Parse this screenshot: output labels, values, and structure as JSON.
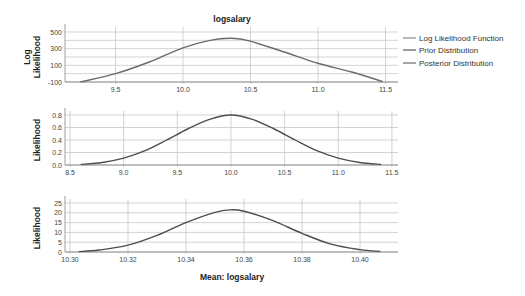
{
  "chart_data": [
    {
      "type": "line",
      "title": "logsalary",
      "xlabel": "",
      "ylabel": "Log Likelihood",
      "x_ticks": [
        "9.5",
        "10.0",
        "10.5",
        "11.0",
        "11.5"
      ],
      "y_ticks": [
        "500",
        "300",
        "100",
        "-100"
      ],
      "xlim": [
        9.125,
        11.6
      ],
      "ylim": [
        -100,
        550
      ],
      "grid": true,
      "series": [
        {
          "name": "Log Likelihood Function",
          "x": [
            9.24,
            9.5,
            9.75,
            10.0,
            10.2,
            10.36,
            10.5,
            10.75,
            11.0,
            11.25,
            11.48
          ],
          "y": [
            -100,
            0,
            140,
            310,
            400,
            425,
            390,
            260,
            125,
            20,
            -95
          ]
        }
      ],
      "legend": [
        "Log Likelihood Function",
        "Prior Distribution",
        "Posterior Distribution"
      ],
      "legend_position": "right"
    },
    {
      "type": "line",
      "title": "",
      "xlabel": "",
      "ylabel": "Likelihood",
      "x_ticks": [
        "8.5",
        "9.0",
        "9.5",
        "10.0",
        "10.5",
        "11.0",
        "11.5"
      ],
      "y_ticks": [
        "0.8",
        "0.6",
        "0.4",
        "0.2",
        "0.0"
      ],
      "xlim": [
        8.45,
        11.52
      ],
      "ylim": [
        0,
        0.85
      ],
      "grid": true,
      "series": [
        {
          "name": "Prior Distribution",
          "x": [
            8.6,
            8.8,
            9.0,
            9.2,
            9.4,
            9.6,
            9.8,
            10.0,
            10.2,
            10.4,
            10.6,
            10.8,
            11.0,
            11.2,
            11.4
          ],
          "y": [
            0.01,
            0.04,
            0.11,
            0.23,
            0.4,
            0.58,
            0.73,
            0.8,
            0.73,
            0.58,
            0.4,
            0.23,
            0.11,
            0.04,
            0.01
          ]
        }
      ]
    },
    {
      "type": "line",
      "title": "",
      "xlabel": "Mean: logsalary",
      "ylabel": "Likelihood",
      "x_ticks": [
        "10.30",
        "10.32",
        "10.34",
        "10.36",
        "10.38",
        "10.40"
      ],
      "y_ticks": [
        "25",
        "20",
        "15",
        "10",
        "5",
        "0"
      ],
      "xlim": [
        10.298,
        10.412
      ],
      "ylim": [
        0,
        27
      ],
      "grid": true,
      "series": [
        {
          "name": "Posterior Distribution",
          "x": [
            10.303,
            10.31,
            10.32,
            10.33,
            10.34,
            10.35,
            10.355,
            10.36,
            10.37,
            10.38,
            10.39,
            10.4,
            10.407
          ],
          "y": [
            0.2,
            1.0,
            3.5,
            8.5,
            15.0,
            20.2,
            21.5,
            20.8,
            16.0,
            9.5,
            4.0,
            1.2,
            0.3
          ]
        }
      ]
    }
  ],
  "labels": {
    "title": "logsalary",
    "chart1_ylabel_line1": "Log",
    "chart1_ylabel_line2": "Likelihood",
    "chart2_ylabel": "Likelihood",
    "chart3_ylabel": "Likelihood",
    "xlabel": "Mean: logsalary",
    "legend": [
      "Log Likelihood Function",
      "Prior Distribution",
      "Posterior Distribution"
    ]
  },
  "colors": {
    "curve": "#6b6b6b",
    "curve_dark": "#4d4d4d",
    "grid": "#c8c8c8",
    "axis": "#888888"
  }
}
